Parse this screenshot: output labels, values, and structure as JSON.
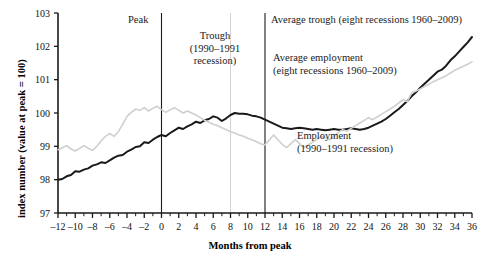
{
  "chart_data": {
    "type": "line",
    "title": "",
    "xlabel": "Months from peak",
    "ylabel": "index number (value at peak = 100)",
    "xlim": [
      -12,
      36
    ],
    "ylim": [
      97,
      103
    ],
    "xticks_major": [
      -12,
      -10,
      -8,
      -6,
      -4,
      -2,
      0,
      2,
      4,
      6,
      8,
      10,
      12,
      14,
      16,
      18,
      20,
      22,
      24,
      26,
      28,
      30,
      32,
      34,
      36
    ],
    "xtick_labels": [
      "–12",
      "–10",
      "–8",
      "–6",
      "–4",
      "–2",
      "0",
      "2",
      "4",
      "6",
      "8",
      "10",
      "12",
      "14",
      "16",
      "18",
      "20",
      "22",
      "24",
      "26",
      "28",
      "30",
      "32",
      "34",
      "36"
    ],
    "xtick_step_minor": 1,
    "yticks": [
      97,
      98,
      99,
      100,
      101,
      102,
      103
    ],
    "ytick_labels": [
      "97",
      "98",
      "99",
      "100",
      "101",
      "102",
      "103"
    ],
    "grid": false,
    "legend_position": "inline-annotations",
    "series": [
      {
        "name": "Average employment (eight recessions 1960–2009)",
        "color": "#1a1a1a",
        "width": 2.0,
        "x": [
          -12,
          -11,
          -10,
          -9,
          -8,
          -7,
          -6,
          -5,
          -4,
          -3,
          -2,
          -1,
          0,
          1,
          2,
          3,
          4,
          5,
          6,
          7,
          8,
          9,
          10,
          11,
          12,
          13,
          14,
          15,
          16,
          17,
          18,
          19,
          20,
          21,
          22,
          23,
          24,
          25,
          26,
          27,
          28,
          29,
          30,
          31,
          32,
          33,
          34,
          35,
          36
        ],
        "values": [
          98.0,
          98.05,
          98.2,
          98.3,
          98.45,
          98.5,
          98.62,
          98.75,
          98.8,
          99.0,
          99.05,
          99.2,
          99.25,
          99.4,
          99.42,
          99.55,
          99.7,
          99.68,
          99.85,
          99.78,
          99.95,
          100.0,
          99.98,
          99.92,
          99.88,
          99.8,
          99.7,
          99.65,
          99.6,
          99.62,
          99.55,
          99.6,
          99.58,
          99.55,
          99.55,
          99.52,
          99.58,
          99.55,
          99.6,
          99.62,
          99.58,
          99.55,
          99.62,
          99.7,
          99.72,
          99.68,
          99.62,
          99.7,
          99.8
        ]
      },
      {
        "name": "Employment (1990–1991 recession)",
        "color": "#cfcfcf",
        "width": 1.6,
        "x": [
          -12,
          -11,
          -10,
          -9,
          -8,
          -7,
          -6,
          -5,
          -4,
          -3,
          -2,
          -1,
          0,
          1,
          2,
          3,
          4,
          5,
          6,
          7,
          8,
          9,
          10,
          11,
          12,
          13,
          14,
          15,
          16,
          17,
          18,
          19,
          20,
          21,
          22,
          23,
          24,
          25,
          26,
          27,
          28,
          29,
          30,
          31,
          32,
          33,
          34,
          35,
          36
        ],
        "values": [
          98.85,
          99.0,
          98.95,
          98.85,
          99.0,
          99.1,
          99.3,
          99.5,
          99.9,
          100.0,
          99.9,
          100.05,
          100.0,
          99.85,
          99.95,
          99.9,
          99.92,
          99.95,
          100.0,
          99.98,
          99.95,
          99.9,
          99.85,
          99.7,
          99.6,
          99.5,
          99.42,
          99.35,
          99.3,
          99.2,
          99.25,
          99.3,
          99.22,
          99.2,
          99.1,
          99.05,
          99.0,
          99.05,
          99.0,
          98.95,
          99.0,
          99.05,
          99.02,
          99.0,
          99.05,
          99.0,
          99.02,
          99.05,
          99.1
        ]
      }
    ],
    "series_segments": [
      {
        "series": 0,
        "note": "full dark trajectory -12..36",
        "x": [
          -12,
          -11.5,
          -11,
          -10.5,
          -10,
          -9.5,
          -9,
          -8.5,
          -8,
          -7.5,
          -7,
          -6.5,
          -6,
          -5.5,
          -5,
          -4.5,
          -4,
          -3.5,
          -3,
          -2.5,
          -2,
          -1.5,
          -1,
          -0.5,
          0,
          0.5,
          1,
          1.5,
          2,
          2.5,
          3,
          3.5,
          4,
          4.5,
          5,
          5.5,
          6,
          6.5,
          7,
          7.5,
          8,
          8.5,
          9,
          9.5,
          10,
          10.5,
          11,
          11.5,
          12,
          12.5,
          13,
          13.5,
          14,
          14.5,
          15,
          15.5,
          16,
          16.5,
          17,
          17.5,
          18,
          18.5,
          19,
          19.5,
          20,
          20.5,
          21,
          21.5,
          22,
          22.5,
          23,
          23.5,
          24,
          24.5,
          25,
          25.5,
          26,
          26.5,
          27,
          27.5,
          28,
          28.5,
          29,
          29.5,
          30,
          30.5,
          31,
          31.5,
          32,
          32.5,
          33,
          33.5,
          34,
          34.5,
          35,
          35.5,
          36
        ],
        "y": [
          98.0,
          98.02,
          98.1,
          98.14,
          98.25,
          98.24,
          98.3,
          98.34,
          98.42,
          98.46,
          98.52,
          98.5,
          98.58,
          98.66,
          98.72,
          98.74,
          98.84,
          98.9,
          98.98,
          99.0,
          99.12,
          99.1,
          99.2,
          99.28,
          99.34,
          99.3,
          99.4,
          99.48,
          99.56,
          99.52,
          99.6,
          99.66,
          99.74,
          99.7,
          99.78,
          99.82,
          99.9,
          99.86,
          99.76,
          99.84,
          99.94,
          100.0,
          99.98,
          99.98,
          99.96,
          99.92,
          99.9,
          99.86,
          99.8,
          99.74,
          99.68,
          99.62,
          99.56,
          99.54,
          99.52,
          99.54,
          99.56,
          99.54,
          99.52,
          99.5,
          99.52,
          99.5,
          99.48,
          99.5,
          99.52,
          99.5,
          99.5,
          99.52,
          99.54,
          99.52,
          99.5,
          99.52,
          99.56,
          99.62,
          99.68,
          99.74,
          99.82,
          99.92,
          100.02,
          100.12,
          100.24,
          100.36,
          100.5,
          100.62,
          100.76,
          100.88,
          101.0,
          101.12,
          101.24,
          101.3,
          101.42,
          101.58,
          101.7,
          101.84,
          101.98,
          102.12,
          102.28,
          102.46,
          102.68
        ]
      },
      {
        "series": 1,
        "note": "full gray trajectory -12..36",
        "x": [
          -12,
          -11.5,
          -11,
          -10.5,
          -10,
          -9.5,
          -9,
          -8.5,
          -8,
          -7.5,
          -7,
          -6.5,
          -6,
          -5.5,
          -5,
          -4.5,
          -4,
          -3.5,
          -3,
          -2.5,
          -2,
          -1.5,
          -1,
          -0.5,
          0,
          0.5,
          1,
          1.5,
          2,
          2.5,
          3,
          3.5,
          4,
          4.5,
          5,
          5.5,
          6,
          6.5,
          7,
          7.5,
          8,
          8.5,
          9,
          9.5,
          10,
          10.5,
          11,
          11.5,
          12,
          12.5,
          13,
          13.5,
          14,
          14.5,
          15,
          15.5,
          16,
          16.5,
          17,
          17.5,
          18,
          18.5,
          19,
          19.5,
          20,
          20.5,
          21,
          21.5,
          22,
          22.5,
          23,
          23.5,
          24,
          24.5,
          25,
          25.5,
          26,
          26.5,
          27,
          27.5,
          28,
          28.5,
          29,
          29.5,
          30,
          30.5,
          31,
          31.5,
          32,
          32.5,
          33,
          33.5,
          34,
          34.5,
          35,
          35.5,
          36
        ],
        "y": [
          98.9,
          98.96,
          99.02,
          98.92,
          98.86,
          98.94,
          99.02,
          98.94,
          98.88,
          99.0,
          99.16,
          99.3,
          99.38,
          99.3,
          99.44,
          99.66,
          99.9,
          100.02,
          100.12,
          100.08,
          100.16,
          100.06,
          100.14,
          100.2,
          100.1,
          100.02,
          100.1,
          100.16,
          100.08,
          100.0,
          100.06,
          100.0,
          99.94,
          99.86,
          99.78,
          99.72,
          99.66,
          99.62,
          99.56,
          99.5,
          99.44,
          99.4,
          99.34,
          99.3,
          99.24,
          99.2,
          99.14,
          99.08,
          99.04,
          99.2,
          99.34,
          99.2,
          99.06,
          98.96,
          99.08,
          99.2,
          99.08,
          98.96,
          99.04,
          99.12,
          99.2,
          99.3,
          99.26,
          99.2,
          99.3,
          99.42,
          99.5,
          99.46,
          99.54,
          99.62,
          99.7,
          99.78,
          99.86,
          99.8,
          99.88,
          99.96,
          100.04,
          100.12,
          100.2,
          100.3,
          100.4,
          100.34,
          100.6,
          100.66,
          100.72,
          100.8,
          100.86,
          100.94,
          101.0,
          101.06,
          101.12,
          101.2,
          101.28,
          101.34,
          101.4,
          101.46,
          101.54
        ]
      }
    ],
    "vlines": [
      {
        "name": "peak-line",
        "x": 0,
        "color": "#1a1a1a",
        "width": 1.1,
        "y_top": 103,
        "y_bottom": 97
      },
      {
        "name": "trough-line",
        "x": 8,
        "color": "#d4d4d4",
        "width": 1.1,
        "y_top": 103,
        "y_bottom": 97
      },
      {
        "name": "average-trough-line",
        "x": 12,
        "color": "#1a1a1a",
        "width": 1.1,
        "y_top": 103,
        "y_bottom": 97
      }
    ],
    "annotations": [
      {
        "name": "peak-label",
        "lines": [
          "Peak"
        ],
        "x_px": 128,
        "y_px": 14,
        "align": "left"
      },
      {
        "name": "trough-label",
        "lines": [
          "Trough",
          "(1990–1991",
          "recession)"
        ],
        "x_px": 172,
        "y_px": 30,
        "align": "center",
        "width_px": 86
      },
      {
        "name": "average-trough-label",
        "lines": [
          "Average trough (eight recessions 1960–2009)"
        ],
        "x_px": 271,
        "y_px": 14,
        "align": "left"
      },
      {
        "name": "average-employment-label",
        "lines": [
          "Average employment",
          "(eight recessions 1960–2009)"
        ],
        "x_px": 273,
        "y_px": 52,
        "align": "left"
      },
      {
        "name": "employment-label",
        "lines": [
          "Employment",
          "(1990–1991 recession)"
        ],
        "x_px": 297,
        "y_px": 130,
        "align": "left"
      }
    ]
  }
}
